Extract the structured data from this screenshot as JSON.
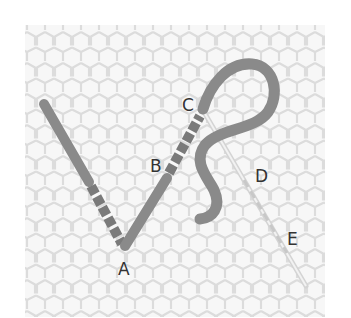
{
  "diagram": {
    "type": "stitch-illustration",
    "background": "hexagonal mesh fabric",
    "labels": [
      {
        "id": "A",
        "text": "A",
        "x": 118,
        "y": 275
      },
      {
        "id": "B",
        "text": "B",
        "x": 150,
        "y": 172
      },
      {
        "id": "C",
        "text": "C",
        "x": 182,
        "y": 111
      },
      {
        "id": "D",
        "text": "D",
        "x": 255,
        "y": 182
      },
      {
        "id": "E",
        "text": "E",
        "x": 287,
        "y": 245
      }
    ],
    "colors": {
      "thread": "#8a8a8a",
      "thread_dark": "#6e6e6e",
      "needle": "#d8d8d8",
      "mesh": "#e6e6e6",
      "label": "#333333"
    }
  }
}
